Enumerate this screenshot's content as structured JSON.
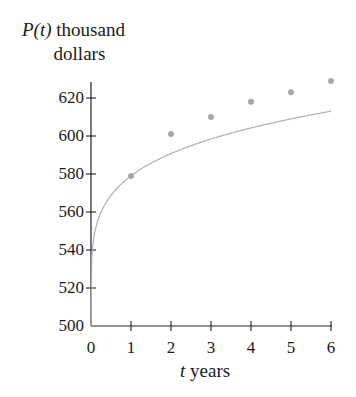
{
  "chart_data": {
    "type": "scatter",
    "title": "",
    "xlabel": "t years",
    "ylabel": "P(t) thousand dollars",
    "ylabel_lines": [
      "P(t) thousand",
      "dollars"
    ],
    "xlabel_var": "t",
    "xlabel_unit": "years",
    "ylabel_var": "P(t)",
    "ylabel_unit_line1": "thousand",
    "ylabel_unit_line2": "dollars",
    "x_ticks": [
      "0",
      "1",
      "2",
      "3",
      "4",
      "5",
      "6"
    ],
    "y_ticks": [
      "500",
      "520",
      "540",
      "560",
      "580",
      "600",
      "620"
    ],
    "xlim": [
      0,
      6
    ],
    "ylim": [
      500,
      630
    ],
    "grid": false,
    "series": [
      {
        "name": "data points",
        "type": "scatter",
        "x": [
          1,
          2,
          3,
          4,
          5,
          6
        ],
        "y": [
          579,
          601,
          610,
          618,
          623,
          629
        ],
        "color": "#a8a8a8"
      },
      {
        "name": "fitted curve",
        "type": "line",
        "description": "logarithmic-type fit starting at (0, 500)",
        "color": "#b0b0b0"
      }
    ]
  }
}
